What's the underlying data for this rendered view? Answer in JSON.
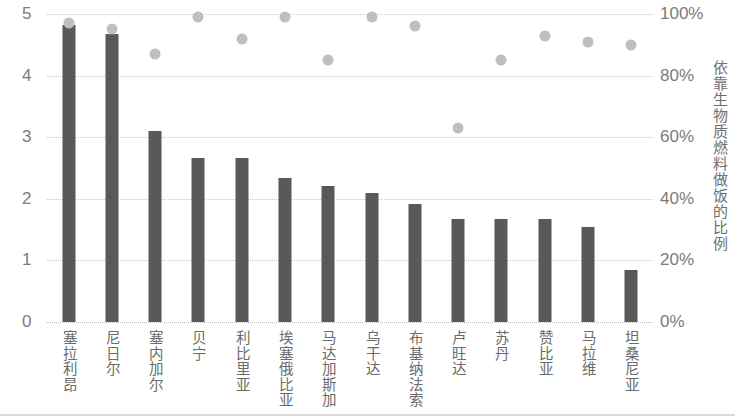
{
  "chart_data": {
    "type": "bar",
    "title": "",
    "subtitle": "",
    "categories": [
      "塞拉利昂",
      "尼日尔",
      "塞内加尔",
      "贝宁",
      "利比里亚",
      "埃塞俄比亚",
      "马达加斯加",
      "乌干达",
      "布基纳法索",
      "卢旺达",
      "苏丹",
      "赞比亚",
      "马拉维",
      "坦桑尼亚"
    ],
    "series": [
      {
        "name": "小时",
        "type": "bar",
        "axis": "left",
        "color": "#595959",
        "values": [
          4.82,
          4.67,
          3.1,
          2.67,
          2.67,
          2.33,
          2.2,
          2.1,
          1.92,
          1.67,
          1.67,
          1.67,
          1.55,
          0.85
        ]
      },
      {
        "name": "依靠生物质燃料做饭的比例",
        "type": "scatter",
        "axis": "right",
        "color": "#bfbfbf",
        "values": [
          97,
          95,
          87,
          99,
          92,
          99,
          85,
          99,
          96,
          63,
          85,
          93,
          91,
          90
        ]
      }
    ],
    "xlabel": "",
    "ylabel": "小时",
    "ylabel_right": "依靠生物质燃料做饭的比例",
    "ylim": [
      0,
      5
    ],
    "ylim_right": [
      0,
      100
    ],
    "yticks": [
      "0",
      "1",
      "2",
      "3",
      "4",
      "5"
    ],
    "ytick_values": [
      0,
      1,
      2,
      3,
      4,
      5
    ],
    "yticks_right": [
      "0%",
      "20%",
      "40%",
      "60%",
      "80%",
      "100%"
    ],
    "ytick_values_right": [
      0,
      20,
      40,
      60,
      80,
      100
    ],
    "grid": true,
    "grid_style": "dotted",
    "legend": "none"
  }
}
